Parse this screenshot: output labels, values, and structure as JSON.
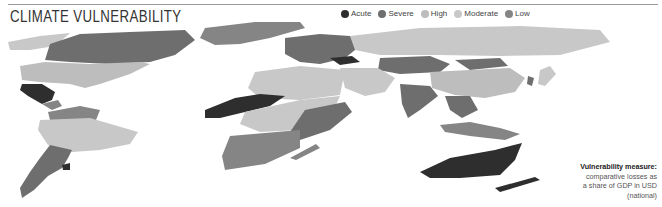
{
  "header": {
    "title": "CLIMATE VULNERABILITY"
  },
  "legend": {
    "items": [
      {
        "label": "Acute",
        "color": "#2e2e2e"
      },
      {
        "label": "Severe",
        "color": "#6e6e6e"
      },
      {
        "label": "High",
        "color": "#bdbdbd"
      },
      {
        "label": "Moderate",
        "color": "#c8c8c8"
      },
      {
        "label": "Low",
        "color": "#858585"
      }
    ]
  },
  "note": {
    "heading": "Vulnerability measure:",
    "line1": "comparative losses as",
    "line2": "a share of GDP in USD",
    "line3": "(national)"
  },
  "map": {
    "regions": [
      {
        "name": "Mexico",
        "level": "Acute"
      },
      {
        "name": "West Africa (Sahel)",
        "level": "Acute"
      },
      {
        "name": "Ukraine",
        "level": "Acute"
      },
      {
        "name": "Australia",
        "level": "Acute"
      },
      {
        "name": "Uruguay",
        "level": "Acute"
      },
      {
        "name": "Canada",
        "level": "Severe"
      },
      {
        "name": "Argentina",
        "level": "Severe"
      },
      {
        "name": "India",
        "level": "Severe"
      },
      {
        "name": "East Africa",
        "level": "Severe"
      },
      {
        "name": "United States",
        "level": "High"
      },
      {
        "name": "Brazil",
        "level": "High"
      },
      {
        "name": "Russia",
        "level": "High"
      },
      {
        "name": "China",
        "level": "High"
      },
      {
        "name": "North Africa",
        "level": "High"
      }
    ]
  }
}
